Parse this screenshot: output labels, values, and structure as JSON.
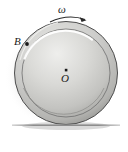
{
  "figure": {
    "kind": "physics-diagram",
    "background": "#ffffff",
    "width": 128,
    "height": 152
  },
  "labels": {
    "omega": "ω",
    "point_b": "B",
    "center_o": "O"
  },
  "colors": {
    "disk_light": "#e8e8e6",
    "disk_mid": "#c9c9c6",
    "disk_dark": "#a8a8a5",
    "rim_stroke": "#4a4a4a",
    "inner_stroke": "#6f6f6f",
    "highlight": "#ffffff",
    "ground": "#8a8a8a",
    "shadow": "#bdbdbd",
    "text": "#1a1a1a"
  },
  "geometry": {
    "disk_center_x": 66,
    "disk_center_y": 73,
    "outer_radius": 52,
    "inner_radius": 44,
    "ground_y": 125,
    "ground_x1": 12,
    "ground_x2": 120,
    "point_b_x": 27,
    "point_b_y": 44,
    "center_dot_x": 66,
    "center_dot_y": 70,
    "arrow_start_x": 50,
    "arrow_end_x": 86,
    "arrow_y": 19
  },
  "elements": {
    "omega_arrow_name": "angular-velocity-arrow",
    "point_b_name": "rim-point-b",
    "center_name": "disk-center-o",
    "ground_name": "ground-line"
  }
}
